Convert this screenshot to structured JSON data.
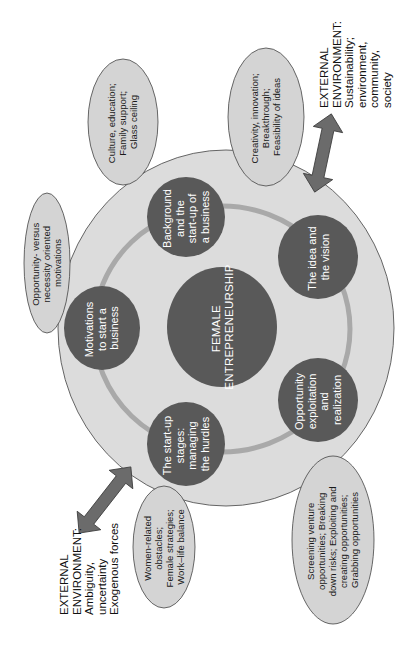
{
  "diagram": {
    "orientation": "rotated-90-ccw",
    "colors": {
      "background": "#ffffff",
      "outer_circle_fill": "#dcdcdc",
      "outer_circle_stroke": "#555555",
      "node_fill": "#595959",
      "ring_stroke": "#a9a9a9",
      "oval_fill": "#d4d4d4",
      "oval_stroke": "#444444",
      "arrow_fill": "#6b6b6b",
      "arrow_stroke": "#3a3a3a"
    },
    "core": {
      "lines": [
        "FEMALE",
        "ENTREPRENEURSHIP"
      ]
    },
    "nodes": [
      {
        "id": "background",
        "lines": [
          "Background",
          "and the",
          "start-up of",
          "a business"
        ]
      },
      {
        "id": "idea",
        "lines": [
          "The idea and",
          "the vision"
        ]
      },
      {
        "id": "opportunity",
        "lines": [
          "Opportunity",
          "exploitation",
          "and",
          "realization"
        ]
      },
      {
        "id": "startup",
        "lines": [
          "The start-up",
          "stages:",
          "managing",
          "the hurdles"
        ]
      },
      {
        "id": "motivations",
        "lines": [
          "Motivations",
          "to start a",
          "business"
        ]
      }
    ],
    "ovals": [
      {
        "id": "culture",
        "lines": [
          "Culture, education;",
          "Family support;",
          "Glass ceiling"
        ]
      },
      {
        "id": "creativity",
        "lines": [
          "Creativity, innovation;",
          "Breakthrough;",
          "Feasibility of ideas"
        ]
      },
      {
        "id": "motivation-type",
        "lines": [
          "Opportunity- versus",
          "necessity oriented",
          "motivations"
        ]
      },
      {
        "id": "women-obstacles",
        "lines": [
          "Women-related",
          "obstacles;",
          "Female strategies;",
          "Work–life balance"
        ]
      },
      {
        "id": "screening",
        "lines": [
          "Screening venture",
          "opportunities; Breaking",
          "down risks; Exploiting and",
          "creating opportunities;",
          "Grabbing opportunities"
        ]
      }
    ],
    "external": [
      {
        "id": "external-top-right",
        "lines": [
          "EXTERNAL",
          "ENVIRONMENT:",
          "Sustainability;",
          "environment,",
          "community,",
          "society"
        ]
      },
      {
        "id": "external-bottom-left",
        "lines": [
          "EXTERNAL",
          "ENVIRONMENT:",
          "Ambiguity,",
          "uncertainty",
          "Exogenous forces"
        ]
      }
    ]
  }
}
